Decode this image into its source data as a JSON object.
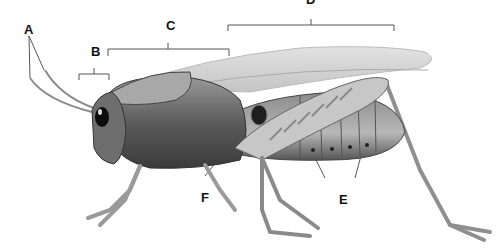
{
  "diagram": {
    "style": "grayscale illustration",
    "labels": [
      {
        "id": "A",
        "text": "A",
        "points_to": "antennae"
      },
      {
        "id": "B",
        "text": "B",
        "points_to": "head"
      },
      {
        "id": "C",
        "text": "C",
        "points_to": "thorax"
      },
      {
        "id": "D",
        "text": "D",
        "points_to": "abdomen / wings"
      },
      {
        "id": "E",
        "text": "E",
        "points_to": "spiracles"
      },
      {
        "id": "F",
        "text": "F",
        "points_to": "tympanum"
      }
    ]
  },
  "colors": {
    "background": "#ffffff",
    "label_text": "#111111",
    "leader_line": "#444444",
    "body_dark": "#3a3a3a",
    "body_mid": "#7a7a7a",
    "body_light": "#b5b5b5",
    "wing": "#d6d6d6"
  }
}
